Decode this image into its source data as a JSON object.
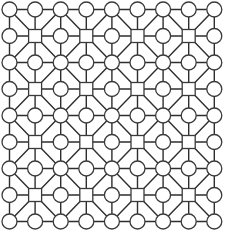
{
  "diagram": {
    "type": "grid-graph",
    "rows": 9,
    "cols": 9,
    "origin": {
      "x": 9.5,
      "y": 9.5
    },
    "spacing": {
      "x": 25.6,
      "y": 26.5
    },
    "node_shapes": {
      "rule": "square where row and column are both odd, circle otherwise",
      "circle_radius": 7.5,
      "square_size": 13
    },
    "edges": {
      "orthogonal": "all horizontally and vertically adjacent nodes connected",
      "diagonal": "each unit cell has one diagonal joining its two corners with even (row+col)"
    },
    "colors": {
      "background": "#ffffff",
      "line": "#2e2e2e",
      "node_fill": "#ffffff",
      "node_stroke": "#3a3a3a"
    }
  }
}
